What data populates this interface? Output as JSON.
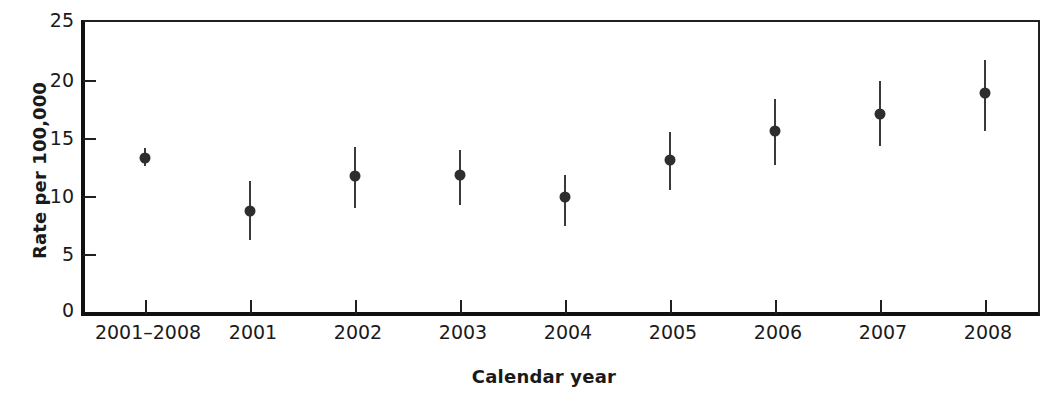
{
  "chart_data": {
    "type": "scatter",
    "title": "",
    "subtitle": "",
    "xlabel": "Calendar year",
    "ylabel": "Rate per 100,000",
    "categories": [
      "2001–2008",
      "2001",
      "2002",
      "2003",
      "2004",
      "2005",
      "2006",
      "2007",
      "2008"
    ],
    "values": [
      13.3,
      8.7,
      11.7,
      11.8,
      9.9,
      13.1,
      15.6,
      17.1,
      18.9
    ],
    "error_low": [
      12.6,
      6.2,
      9.0,
      9.2,
      7.4,
      10.5,
      12.7,
      14.3,
      15.6
    ],
    "error_high": [
      14.1,
      11.3,
      14.2,
      14.0,
      11.8,
      15.5,
      18.4,
      19.9,
      21.7
    ],
    "ylim": [
      0,
      25
    ],
    "yticks": [
      0,
      5,
      10,
      15,
      20,
      25
    ],
    "ytick_labels": [
      "0",
      "5",
      "10",
      "15",
      "20",
      "25"
    ],
    "grid": false,
    "legend": null,
    "legend_position": "none",
    "marker": "filled-circle",
    "errorbar_style": "vertical-line",
    "series": [
      {
        "name": "Rate per 100,000",
        "points": [
          {
            "category": "2001–2008",
            "value": 13.3,
            "low": 12.6,
            "high": 14.1
          },
          {
            "category": "2001",
            "value": 8.7,
            "low": 6.2,
            "high": 11.3
          },
          {
            "category": "2002",
            "value": 11.7,
            "low": 9.0,
            "high": 14.2
          },
          {
            "category": "2003",
            "value": 11.8,
            "low": 9.2,
            "high": 14.0
          },
          {
            "category": "2004",
            "value": 9.9,
            "low": 7.4,
            "high": 11.8
          },
          {
            "category": "2005",
            "value": 13.1,
            "low": 10.5,
            "high": 15.5
          },
          {
            "category": "2006",
            "value": 15.6,
            "low": 12.7,
            "high": 18.4
          },
          {
            "category": "2007",
            "value": 17.1,
            "low": 14.3,
            "high": 19.9
          },
          {
            "category": "2008",
            "value": 18.9,
            "low": 15.6,
            "high": 21.7
          }
        ]
      }
    ],
    "colors": {
      "marker": "#2e2e2e",
      "errorbar": "#3a3a3a",
      "axis": "#231f20",
      "text": "#1a1a1a",
      "background": "#ffffff"
    }
  }
}
